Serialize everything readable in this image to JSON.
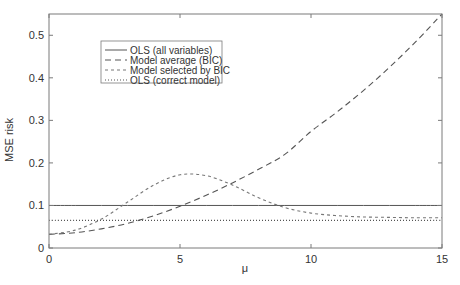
{
  "chart_data": {
    "type": "line",
    "title": "",
    "xlabel": "μ",
    "ylabel": "MSE risk",
    "xlim": [
      0,
      15
    ],
    "ylim": [
      0,
      0.55
    ],
    "xticks": [
      0,
      5,
      10,
      15
    ],
    "xtick_labels": [
      "0",
      "5",
      "10",
      "15"
    ],
    "yticks": [
      0,
      0.1,
      0.2,
      0.3,
      0.4,
      0.5
    ],
    "ytick_labels": [
      "0",
      "0.1",
      "0.2",
      "0.3",
      "0.4",
      "0.5"
    ],
    "grid": false,
    "legend_position": "upper-left (inside)",
    "x": [
      0,
      1,
      2,
      3,
      4,
      5,
      6,
      7,
      8,
      9,
      10,
      11,
      12,
      13,
      14,
      15
    ],
    "series": [
      {
        "name": "OLS (all variables)",
        "style": "solid",
        "values": [
          0.1,
          0.1,
          0.1,
          0.1,
          0.1,
          0.1,
          0.1,
          0.1,
          0.1,
          0.1,
          0.1,
          0.1,
          0.1,
          0.1,
          0.1,
          0.1
        ]
      },
      {
        "name": "Model average (BIC)",
        "style": "dashed",
        "values": [
          0.032,
          0.036,
          0.045,
          0.058,
          0.076,
          0.098,
          0.124,
          0.153,
          0.185,
          0.22,
          0.274,
          0.32,
          0.37,
          0.425,
          0.485,
          0.55
        ]
      },
      {
        "name": "Model selected by BIC",
        "style": "short-dashed",
        "values": [
          0.032,
          0.042,
          0.068,
          0.108,
          0.148,
          0.172,
          0.17,
          0.148,
          0.118,
          0.095,
          0.082,
          0.076,
          0.073,
          0.072,
          0.071,
          0.071
        ]
      },
      {
        "name": "OLS (correct model)",
        "style": "dotted",
        "values": [
          0.065,
          0.065,
          0.065,
          0.065,
          0.065,
          0.065,
          0.065,
          0.065,
          0.065,
          0.065,
          0.065,
          0.065,
          0.065,
          0.065,
          0.065,
          0.065
        ]
      }
    ]
  },
  "legend": {
    "items": [
      {
        "label": "OLS (all variables)",
        "style": "solid"
      },
      {
        "label": "Model average (BIC)",
        "style": "dashed"
      },
      {
        "label": "Model selected by BIC",
        "style": "short-dashed"
      },
      {
        "label": "OLS (correct model)",
        "style": "dotted"
      }
    ]
  },
  "colors": {
    "axis": "#7a7a7a",
    "ols_all": "#555555",
    "model_avg": "#555555",
    "bic": "#777777",
    "ols_correct": "#555555",
    "text": "#333333"
  }
}
